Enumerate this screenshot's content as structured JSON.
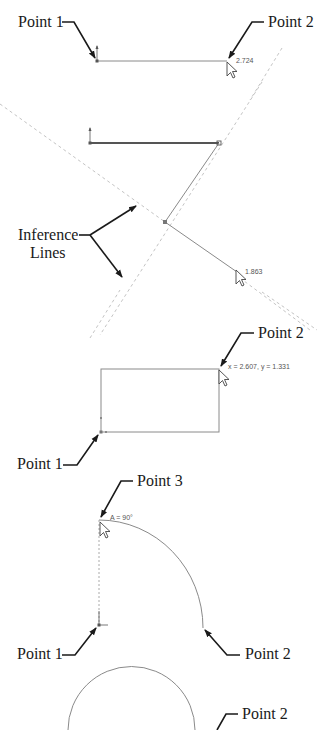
{
  "colors": {
    "background": "#ffffff",
    "callout": "#1a1a1a",
    "sketch_line": "#8a8a8a",
    "sketch_line_bold": "#555555",
    "inference_line": "#c4c4c4",
    "dimension_text": "#555555"
  },
  "panels": [
    {
      "id": "line",
      "labels": {
        "point1": "Point 1",
        "point2": "Point 2"
      },
      "dimension": "2.724"
    },
    {
      "id": "inference",
      "labels": {
        "inference_line1": "Inference",
        "inference_line2": "Lines"
      },
      "dimension": "1.863"
    },
    {
      "id": "rectangle",
      "labels": {
        "point1": "Point 1",
        "point2": "Point 2"
      },
      "coordinates": "x = 2.607, y = 1.331"
    },
    {
      "id": "arc",
      "labels": {
        "point1": "Point 1",
        "point2": "Point 2",
        "point3": "Point 3"
      },
      "angle": "A = 90°"
    },
    {
      "id": "circle",
      "labels": {
        "point2": "Point 2"
      }
    }
  ],
  "icons": [
    "arrow-cursor-icon",
    "origin-icon",
    "endpoint-marker-icon"
  ]
}
